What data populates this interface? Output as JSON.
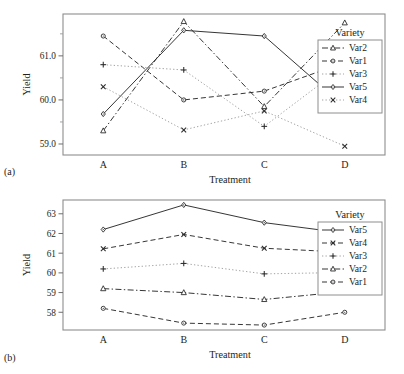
{
  "figure": {
    "panels": [
      {
        "tag": "(a)",
        "xlabel": "Treatment",
        "ylabel": "Yield",
        "legend_title": "Variety"
      },
      {
        "tag": "(b)",
        "xlabel": "Treatment",
        "ylabel": "Yield",
        "legend_title": "Variety"
      }
    ]
  },
  "chart_data": [
    {
      "type": "line",
      "panel": "(a)",
      "title": "",
      "xlabel": "Treatment",
      "ylabel": "Yield",
      "legend_title": "Variety",
      "legend_position": "right-top-inside",
      "grid": false,
      "categories": [
        "A",
        "B",
        "C",
        "D"
      ],
      "xtick_labels": [
        "A",
        "B",
        "C",
        "D"
      ],
      "ytick_labels": [
        "59.0",
        "60.0",
        "61.0"
      ],
      "ytick_values": [
        59.0,
        60.0,
        61.0
      ],
      "yminor_ticks": [
        58.75,
        59.5,
        60.5,
        61.5
      ],
      "ylim": [
        58.75,
        61.95
      ],
      "legend_order": [
        "Var2",
        "Var1",
        "Var3",
        "Var5",
        "Var4"
      ],
      "series": [
        {
          "name": "Var2",
          "marker": "triangle",
          "dash": "dashdot",
          "values": [
            59.3,
            61.78,
            59.85,
            61.75
          ]
        },
        {
          "name": "Var1",
          "marker": "circle",
          "dash": "dashed",
          "values": [
            61.45,
            60.0,
            60.2,
            60.85
          ]
        },
        {
          "name": "Var3",
          "marker": "plus",
          "dash": "dotted",
          "values": [
            60.8,
            60.68,
            59.4,
            60.78
          ]
        },
        {
          "name": "Var5",
          "marker": "diamond",
          "dash": "solid",
          "values": [
            59.68,
            61.58,
            61.45,
            59.85
          ]
        },
        {
          "name": "Var4",
          "marker": "cross",
          "dash": "dotted",
          "values": [
            60.3,
            59.32,
            59.75,
            58.95
          ]
        }
      ]
    },
    {
      "type": "line",
      "panel": "(b)",
      "title": "",
      "xlabel": "Treatment",
      "ylabel": "Yield",
      "legend_title": "Variety",
      "legend_position": "right-middle-inside",
      "grid": false,
      "categories": [
        "A",
        "B",
        "C",
        "D"
      ],
      "xtick_labels": [
        "A",
        "B",
        "C",
        "D"
      ],
      "ytick_labels": [
        "58",
        "59",
        "60",
        "61",
        "62",
        "63"
      ],
      "ytick_values": [
        58,
        59,
        60,
        61,
        62,
        63
      ],
      "ylim": [
        57.1,
        63.7
      ],
      "legend_order": [
        "Var5",
        "Var4",
        "Var3",
        "Var2",
        "Var1"
      ],
      "series": [
        {
          "name": "Var5",
          "marker": "diamond",
          "dash": "solid",
          "values": [
            62.2,
            63.45,
            62.55,
            62.02
          ]
        },
        {
          "name": "Var4",
          "marker": "cross",
          "dash": "dashed",
          "values": [
            61.22,
            61.95,
            61.25,
            61.05
          ]
        },
        {
          "name": "Var3",
          "marker": "plus",
          "dash": "dotted",
          "values": [
            60.2,
            60.48,
            59.95,
            60.02
          ]
        },
        {
          "name": "Var2",
          "marker": "triangle",
          "dash": "dashdot",
          "values": [
            59.2,
            59.0,
            58.65,
            59.05
          ]
        },
        {
          "name": "Var1",
          "marker": "circle",
          "dash": "dashed",
          "values": [
            58.2,
            57.45,
            57.35,
            58.0
          ]
        }
      ]
    }
  ]
}
